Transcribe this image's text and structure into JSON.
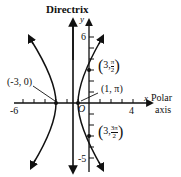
{
  "diagram": {
    "title": "Directrix",
    "y_axis_label": "y",
    "x_axis_label": "x",
    "polar_axis_label_1": "Polar",
    "polar_axis_label_2": "axis",
    "origin_label": "O",
    "ticks": {
      "x_neg": "-6",
      "x_pos": "4",
      "y_pos": "6",
      "y_neg": "-5"
    },
    "points": {
      "p1": "(-3, 0)",
      "p2": "(1, π)",
      "p3_left": "3,",
      "p3_num": "π",
      "p3_den": "2",
      "p4_left": "3,",
      "p4_num": "3π",
      "p4_den": "2"
    },
    "equation_hint": "(x+2)^2 - y^2/3 = 1",
    "colors": {
      "ink": "#111111",
      "background": "#ffffff"
    }
  }
}
